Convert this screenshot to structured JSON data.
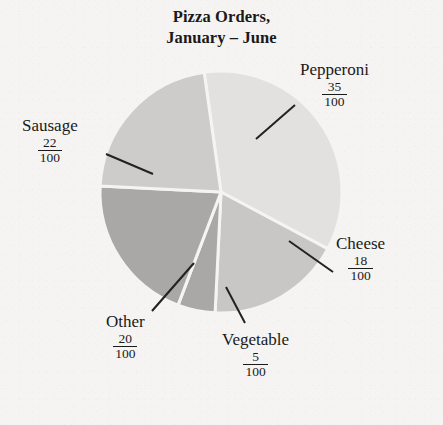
{
  "title": {
    "line1": "Pizza Orders,",
    "line2": "January – June"
  },
  "chart_data": {
    "type": "pie",
    "title": "Pizza Orders, January – June",
    "subtitle": "",
    "xlabel": "",
    "ylabel": "",
    "total": 100,
    "units": "orders out of 100",
    "legend": "none (direct labels with leader lines)",
    "grid": false,
    "start_angle_deg": 352,
    "direction": "clockwise",
    "categories": [
      "Pepperoni",
      "Cheese",
      "Vegetable",
      "Other",
      "Sausage"
    ],
    "values": [
      35,
      18,
      5,
      20,
      22
    ],
    "labels_fraction": [
      "35/100",
      "18/100",
      "5/100",
      "20/100",
      "22/100"
    ],
    "slices": [
      {
        "name": "Pepperoni",
        "value": 35,
        "numerator": "35",
        "denominator": "100",
        "color": "#e2e1df",
        "start_deg": 352,
        "end_deg": 478
      },
      {
        "name": "Cheese",
        "value": 18,
        "numerator": "18",
        "denominator": "100",
        "color": "#c8c7c5",
        "start_deg": 478,
        "end_deg": 542.8
      },
      {
        "name": "Vegetable",
        "value": 5,
        "numerator": "5",
        "denominator": "100",
        "color": "#a9a8a6",
        "start_deg": 542.8,
        "end_deg": 560.8
      },
      {
        "name": "Other",
        "value": 20,
        "numerator": "20",
        "denominator": "100",
        "color": "#a9a8a6",
        "start_deg": 560.8,
        "end_deg": 632.8
      },
      {
        "name": "Sausage",
        "value": 22,
        "numerator": "22",
        "denominator": "100",
        "color": "#cdccca",
        "start_deg": 632.8,
        "end_deg": 712
      }
    ],
    "geometry": {
      "center_x": 221,
      "center_y": 192,
      "radius": 121,
      "separator_color": "#f5f4f2",
      "separator_width": 3
    },
    "colors": {
      "background": "#f5f4f2",
      "text": "#1a1a1a",
      "leader_line": "#222222"
    }
  },
  "labels": {
    "pepperoni": {
      "name": "Pepperoni",
      "num": "35",
      "den": "100"
    },
    "sausage": {
      "name": "Sausage",
      "num": "22",
      "den": "100"
    },
    "cheese": {
      "name": "Cheese",
      "num": "18",
      "den": "100"
    },
    "other": {
      "name": "Other",
      "num": "20",
      "den": "100"
    },
    "vegetable": {
      "name": "Vegetable",
      "num": "5",
      "den": "100"
    }
  }
}
